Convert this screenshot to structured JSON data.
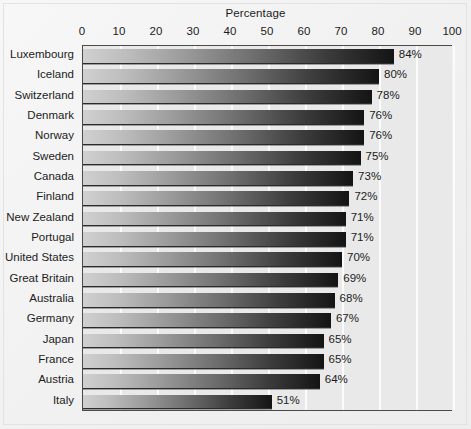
{
  "chart_data": {
    "type": "bar",
    "orientation": "horizontal",
    "title": "Percentage",
    "xlabel": "Percentage",
    "ylabel": "",
    "xlim": [
      0,
      100
    ],
    "grid": true,
    "legend": null,
    "tick_labels": [
      "0",
      "10",
      "20",
      "30",
      "40",
      "50",
      "60",
      "70",
      "80",
      "90",
      "100"
    ],
    "tick_values": [
      0,
      10,
      20,
      30,
      40,
      50,
      60,
      70,
      80,
      90,
      100
    ],
    "categories": [
      "Luxembourg",
      "Iceland",
      "Switzerland",
      "Denmark",
      "Norway",
      "Sweden",
      "Canada",
      "Finland",
      "New Zealand",
      "Portugal",
      "United States",
      "Great Britain",
      "Australia",
      "Germany",
      "Japan",
      "France",
      "Austria",
      "Italy"
    ],
    "values": [
      84,
      80,
      78,
      76,
      76,
      75,
      73,
      72,
      71,
      71,
      70,
      69,
      68,
      67,
      65,
      65,
      64,
      51
    ],
    "value_labels": [
      "84%",
      "80%",
      "78%",
      "76%",
      "76%",
      "75%",
      "73%",
      "72%",
      "71%",
      "71%",
      "70%",
      "69%",
      "68%",
      "67%",
      "65%",
      "65%",
      "64%",
      "51%"
    ],
    "colors": {
      "bar_gradient_start": "#d0d0d0",
      "bar_gradient_end": "#141414",
      "plot_background": "#e9e9e9",
      "gridline": "#fbfbfb",
      "axis": "#4a4a4a",
      "page_background": "#f3f3f3",
      "text": "#1c1c1c"
    }
  }
}
